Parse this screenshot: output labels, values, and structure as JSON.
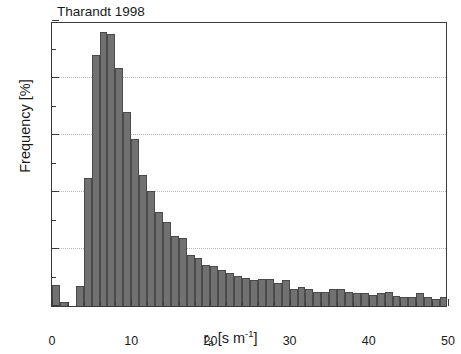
{
  "chart_data": {
    "type": "bar",
    "title": "Tharandt 1998",
    "xlabel": "r_a [s m^-1]",
    "xlabel_parts": {
      "var": "r",
      "var_sub": "a",
      "unit_open": " [s m",
      "unit_sup": "-1",
      "unit_close": "]"
    },
    "ylabel": "Frequency [%]",
    "xlim": [
      0,
      50
    ],
    "ylim": [
      0,
      10
    ],
    "x_major_ticks": [
      0,
      10,
      20,
      30,
      40,
      50
    ],
    "x_major_tick_labels": [
      "0",
      "10",
      "20",
      "30",
      "40",
      "50"
    ],
    "x_minor_tick_step": 2,
    "y_major_ticks": [
      0,
      2,
      4,
      6,
      8,
      10
    ],
    "y_major_tick_labels": [
      "0",
      "2",
      "4",
      "6",
      "8",
      "10"
    ],
    "y_minor_tick_step": 1,
    "grid": "horizontal-dotted-at-major-y",
    "legend": null,
    "bin_width": 1,
    "bar_color": "#717171",
    "bar_edge_color": "#4a4a4a",
    "frame_color": "#3a3a3a",
    "grid_color": "#b9b9b9",
    "bin_left_edges": [
      0,
      1,
      2,
      3,
      4,
      5,
      6,
      7,
      8,
      9,
      10,
      11,
      12,
      13,
      14,
      15,
      16,
      17,
      18,
      19,
      20,
      21,
      22,
      23,
      24,
      25,
      26,
      27,
      28,
      29,
      30,
      31,
      32,
      33,
      34,
      35,
      36,
      37,
      38,
      39,
      40,
      41,
      42,
      43,
      44,
      45,
      46,
      47,
      48,
      49
    ],
    "values": [
      0.75,
      0.15,
      0.0,
      0.7,
      4.5,
      8.8,
      9.6,
      9.55,
      8.35,
      6.8,
      5.85,
      4.6,
      4.05,
      3.3,
      2.95,
      2.45,
      2.4,
      1.8,
      1.7,
      1.45,
      1.4,
      1.25,
      1.15,
      1.05,
      1.0,
      0.9,
      0.95,
      0.95,
      0.8,
      0.9,
      0.6,
      0.65,
      0.6,
      0.5,
      0.5,
      0.6,
      0.6,
      0.5,
      0.45,
      0.45,
      0.4,
      0.45,
      0.5,
      0.35,
      0.3,
      0.3,
      0.45,
      0.3,
      0.25,
      0.3
    ]
  },
  "figure": {
    "title": "Tharandt 1998",
    "y_axis_title": "Frequency [%]"
  }
}
